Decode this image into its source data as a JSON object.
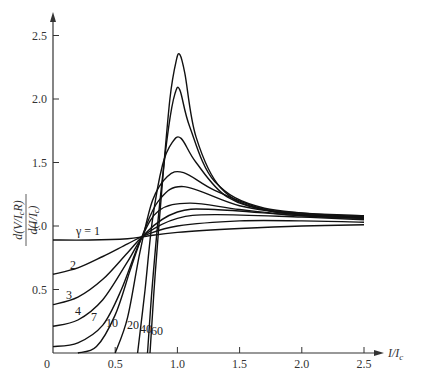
{
  "chart_data": {
    "type": "line",
    "title": "",
    "xlabel": "I/I_c",
    "ylabel": "d(V/I_cR) / d(I/I_c)",
    "xlim": [
      0,
      2.5
    ],
    "ylim": [
      0,
      2.5
    ],
    "grid": false,
    "x_ticks": [
      "0",
      "0.5",
      "1.0",
      "1.5",
      "2.0",
      "2.5"
    ],
    "y_ticks": [
      "0",
      "0.5",
      "1.0",
      "1.5",
      "2.0",
      "2.5"
    ],
    "legend": "inline curve labels (γ values)",
    "series": [
      {
        "name": "γ = 1",
        "label": "γ = 1",
        "points": [
          [
            0,
            0.89
          ],
          [
            0.3,
            0.89
          ],
          [
            0.6,
            0.9
          ],
          [
            0.75,
            0.92
          ],
          [
            1.0,
            0.95
          ],
          [
            1.5,
            0.98
          ],
          [
            2.0,
            1.0
          ],
          [
            2.5,
            1.01
          ]
        ]
      },
      {
        "name": "2",
        "label": "2",
        "points": [
          [
            0,
            0.62
          ],
          [
            0.2,
            0.67
          ],
          [
            0.4,
            0.76
          ],
          [
            0.6,
            0.86
          ],
          [
            0.75,
            0.93
          ],
          [
            1.0,
            1.0
          ],
          [
            1.5,
            1.04
          ],
          [
            2.0,
            1.04
          ],
          [
            2.5,
            1.03
          ]
        ]
      },
      {
        "name": "3",
        "label": "3",
        "points": [
          [
            0,
            0.38
          ],
          [
            0.2,
            0.44
          ],
          [
            0.4,
            0.58
          ],
          [
            0.6,
            0.79
          ],
          [
            0.75,
            0.94
          ],
          [
            1.0,
            1.06
          ],
          [
            1.3,
            1.09
          ],
          [
            2.0,
            1.07
          ],
          [
            2.5,
            1.05
          ]
        ]
      },
      {
        "name": "4",
        "label": "4",
        "points": [
          [
            0,
            0.21
          ],
          [
            0.2,
            0.26
          ],
          [
            0.4,
            0.42
          ],
          [
            0.6,
            0.72
          ],
          [
            0.75,
            0.95
          ],
          [
            1.0,
            1.11
          ],
          [
            1.3,
            1.13
          ],
          [
            2.0,
            1.08
          ],
          [
            2.5,
            1.06
          ]
        ]
      },
      {
        "name": "7",
        "label": "7",
        "points": [
          [
            0,
            0.05
          ],
          [
            0.2,
            0.08
          ],
          [
            0.4,
            0.22
          ],
          [
            0.55,
            0.5
          ],
          [
            0.7,
            0.88
          ],
          [
            0.85,
            1.12
          ],
          [
            1.1,
            1.18
          ],
          [
            1.5,
            1.13
          ],
          [
            2.0,
            1.08
          ],
          [
            2.5,
            1.06
          ]
        ]
      },
      {
        "name": "10",
        "label": "10",
        "points": [
          [
            0.2,
            0.0
          ],
          [
            0.35,
            0.05
          ],
          [
            0.5,
            0.3
          ],
          [
            0.62,
            0.65
          ],
          [
            0.72,
            0.93
          ],
          [
            0.85,
            1.2
          ],
          [
            1.05,
            1.31
          ],
          [
            1.5,
            1.16
          ],
          [
            2.0,
            1.09
          ],
          [
            2.5,
            1.07
          ]
        ]
      },
      {
        "name": "20",
        "label": "20",
        "points": [
          [
            0.5,
            0.0
          ],
          [
            0.6,
            0.28
          ],
          [
            0.7,
            0.8
          ],
          [
            0.8,
            1.2
          ],
          [
            0.92,
            1.39
          ],
          [
            1.05,
            1.42
          ],
          [
            1.3,
            1.28
          ],
          [
            1.7,
            1.13
          ],
          [
            2.0,
            1.09
          ],
          [
            2.5,
            1.07
          ]
        ]
      },
      {
        "name": "40",
        "label": "40",
        "points": [
          [
            0.68,
            0.0
          ],
          [
            0.74,
            0.5
          ],
          [
            0.8,
            1.05
          ],
          [
            0.88,
            1.48
          ],
          [
            0.96,
            1.66
          ],
          [
            1.03,
            1.69
          ],
          [
            1.15,
            1.5
          ],
          [
            1.4,
            1.23
          ],
          [
            1.8,
            1.11
          ],
          [
            2.5,
            1.07
          ]
        ]
      },
      {
        "name": "60",
        "label": "60",
        "points": [
          [
            0.76,
            0.0
          ],
          [
            0.8,
            0.55
          ],
          [
            0.86,
            1.2
          ],
          [
            0.93,
            1.78
          ],
          [
            0.98,
            2.04
          ],
          [
            1.02,
            2.07
          ],
          [
            1.1,
            1.78
          ],
          [
            1.3,
            1.35
          ],
          [
            1.7,
            1.14
          ],
          [
            2.5,
            1.07
          ]
        ]
      },
      {
        "name": "γ → large (peak 2.35)",
        "label": "",
        "points": [
          [
            0.78,
            0.0
          ],
          [
            0.82,
            0.6
          ],
          [
            0.88,
            1.35
          ],
          [
            0.94,
            2.0
          ],
          [
            0.99,
            2.3
          ],
          [
            1.02,
            2.35
          ],
          [
            1.06,
            2.2
          ],
          [
            1.15,
            1.7
          ],
          [
            1.35,
            1.3
          ],
          [
            1.7,
            1.13
          ],
          [
            2.5,
            1.08
          ]
        ]
      }
    ]
  },
  "labels": {
    "xlabel": "I/I",
    "xlabel_sub": "c",
    "ylabel_num": "d(V/I",
    "ylabel_num_sub": "c",
    "ylabel_num_end": "R)",
    "ylabel_den": "d(I/I",
    "ylabel_den_sub": "c",
    "ylabel_den_end": ")",
    "origin": "0"
  }
}
